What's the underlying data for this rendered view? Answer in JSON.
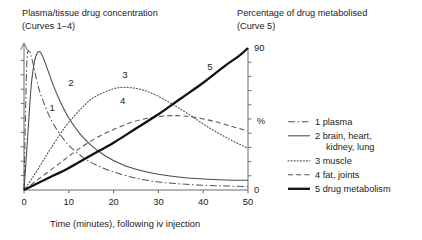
{
  "chart_data": {
    "type": "line",
    "title_left": "Plasma/tissue drug concentration",
    "title_left_sub": "(Curves 1–4)",
    "title_right": "Percentage of drug metabolised",
    "title_right_sub": "(Curve 5)",
    "xlabel": "Time (minutes), following iv injection",
    "ylabel_left": "",
    "ylabel_right": "%",
    "xlim": [
      0,
      50
    ],
    "xticks": [
      0,
      10,
      20,
      30,
      40,
      50
    ],
    "xticklabels": [
      "0",
      "10",
      "20",
      "30",
      "40",
      "50"
    ],
    "ylim_left": [
      0,
      100
    ],
    "left_axis_ticks": 9,
    "left_axis_arrow": true,
    "left_axis_labelled": false,
    "ylim_right": [
      0,
      90
    ],
    "yticks_right": [
      0,
      90
    ],
    "yticklabels_right": [
      "0",
      "90"
    ],
    "right_axis_minor_ticks": 9,
    "grid": false,
    "legend_position": "right",
    "series": [
      {
        "name": "plasma",
        "number": "1",
        "legend_label": "1  plasma",
        "style": "dashdot",
        "axis": "left",
        "inline_label": "1",
        "inline_label_x": 6.3,
        "inline_label_y": 55,
        "x": [
          0,
          0.6,
          1.2,
          2,
          3,
          4,
          6,
          8,
          10,
          13,
          16,
          20,
          25,
          30,
          35,
          40,
          45,
          50
        ],
        "y": [
          0,
          86,
          96,
          88,
          74,
          64,
          49,
          39,
          31,
          23,
          17.5,
          12.5,
          8.2,
          5.6,
          4.2,
          3.3,
          2.8,
          2.4
        ]
      },
      {
        "name": "brain, heart, kidney, lung",
        "number": "2",
        "legend_label": "2  brain, heart,",
        "legend_label_line2": "kidney, lung",
        "style": "solid",
        "axis": "left",
        "inline_label": "2",
        "inline_label_x": 10.5,
        "inline_label_y": 72,
        "x": [
          0,
          0.8,
          1.6,
          2.4,
          3.2,
          4,
          5,
          6.5,
          8,
          10,
          12.5,
          15,
          18,
          22,
          26,
          30,
          35,
          40,
          45,
          50
        ],
        "y": [
          0,
          36,
          72,
          90,
          96,
          94,
          86,
          73,
          62,
          50,
          39,
          31,
          24,
          17.5,
          13.5,
          11,
          8.8,
          7.6,
          7,
          6.8
        ]
      },
      {
        "name": "muscle",
        "number": "3",
        "legend_label": "3  muscle",
        "style": "dotted",
        "axis": "left",
        "inline_label": "3",
        "inline_label_x": 22.5,
        "inline_label_y": 78,
        "x": [
          0,
          2,
          4,
          6,
          9,
          12,
          15,
          18,
          21,
          24,
          27,
          30,
          34,
          38,
          42,
          46,
          50
        ],
        "y": [
          0,
          9,
          19,
          29,
          43,
          54,
          63,
          68,
          71,
          71,
          69,
          65,
          58,
          50,
          42,
          35,
          29
        ]
      },
      {
        "name": "fat, joints",
        "number": "4",
        "legend_label": "4  fat, joints",
        "style": "dashed",
        "axis": "left",
        "inline_label": "4",
        "inline_label_x": 22.0,
        "inline_label_y": 60,
        "x": [
          0,
          3,
          6,
          9,
          12,
          16,
          20,
          24,
          28,
          32,
          35,
          38,
          42,
          46,
          50
        ],
        "y": [
          0,
          7,
          14,
          21,
          28,
          36,
          42,
          47,
          50,
          51.5,
          51.5,
          50.5,
          48,
          44.5,
          41
        ]
      },
      {
        "name": "drug metabolism",
        "number": "5",
        "legend_label": "5  drug metabolism",
        "style": "thick-solid",
        "axis": "right",
        "inline_label": "5",
        "inline_label_x": 41.5,
        "inline_label_y": 76,
        "x": [
          0,
          5,
          10,
          15,
          20,
          25,
          30,
          35,
          40,
          45,
          48,
          50
        ],
        "y": [
          0,
          7,
          14,
          22,
          30,
          39,
          48,
          58,
          68,
          79,
          85,
          90
        ]
      }
    ]
  },
  "legend": {
    "items": [
      {
        "label": "1  plasma",
        "label2": "",
        "style": "dashdot"
      },
      {
        "label": "2  brain, heart,",
        "label2": "kidney, lung",
        "style": "solid"
      },
      {
        "label": "3  muscle",
        "label2": "",
        "style": "dotted"
      },
      {
        "label": "4  fat, joints",
        "label2": "",
        "style": "dashed"
      },
      {
        "label": "5  drug metabolism",
        "label2": "",
        "style": "thick-solid"
      }
    ]
  }
}
